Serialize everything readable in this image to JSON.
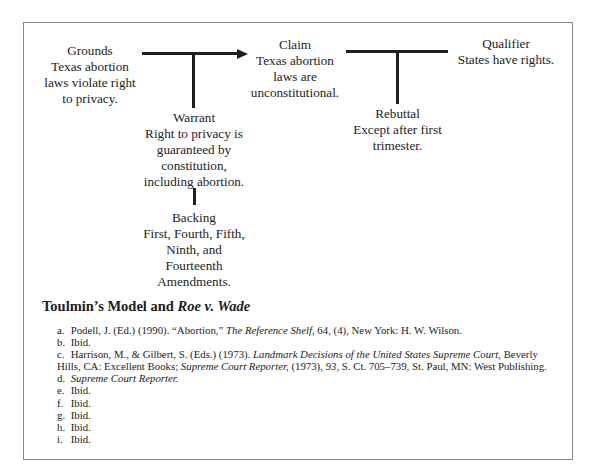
{
  "diagram": {
    "grounds": {
      "title": "Grounds",
      "lines": [
        "Texas abortion",
        "laws violate right",
        "to privacy."
      ]
    },
    "claim": {
      "title": "Claim",
      "lines": [
        "Texas abortion",
        "laws are",
        "unconstitutional."
      ]
    },
    "qualifier": {
      "title": "Qualifier",
      "lines": [
        "States have rights."
      ]
    },
    "warrant": {
      "title": "Warrant",
      "lines": [
        "Right to privacy is",
        "guaranteed by",
        "constitution,",
        "including abortion."
      ]
    },
    "rebuttal": {
      "title": "Rebuttal",
      "lines": [
        "Except after first",
        "trimester."
      ]
    },
    "backing": {
      "title": "Backing",
      "lines": [
        "First, Fourth, Fifth,",
        "Ninth, and",
        "Fourteenth",
        "Amendments."
      ]
    }
  },
  "caption": {
    "prefix": "Toulmin’s Model and ",
    "italic": "Roe v. Wade"
  },
  "notes": [
    {
      "label": "a.",
      "parts": [
        {
          "t": "Podell, J. (Ed.) (1990). “Abortion,” "
        },
        {
          "t": "The Reference Shelf",
          "i": true
        },
        {
          "t": ", 64, (4), New York: H. W. Wilson."
        }
      ]
    },
    {
      "label": "b.",
      "parts": [
        {
          "t": "Ibid."
        }
      ]
    },
    {
      "label": "c.",
      "parts": [
        {
          "t": "Harrison, M., & Gilbert, S. (Eds.) (1973). "
        },
        {
          "t": "Landmark Decisions of the United States Supreme Court",
          "i": true
        },
        {
          "t": ", Beverly Hills, CA: Excellent Books; "
        },
        {
          "t": "Supreme Court Reporter,",
          "i": true
        },
        {
          "t": " (1973), "
        },
        {
          "t": "93",
          "i": true
        },
        {
          "t": ", S. Ct. 705–739, St. Paul, MN: West Publishing."
        }
      ]
    },
    {
      "label": "d.",
      "parts": [
        {
          "t": "Supreme Court Reporter.",
          "i": true
        }
      ]
    },
    {
      "label": "e.",
      "parts": [
        {
          "t": "Ibid."
        }
      ]
    },
    {
      "label": "f.",
      "parts": [
        {
          "t": "Ibid."
        }
      ]
    },
    {
      "label": "g.",
      "parts": [
        {
          "t": "Ibid."
        }
      ]
    },
    {
      "label": "h.",
      "parts": [
        {
          "t": "Ibid."
        }
      ]
    },
    {
      "label": "i.",
      "parts": [
        {
          "t": "Ibid."
        }
      ]
    }
  ]
}
